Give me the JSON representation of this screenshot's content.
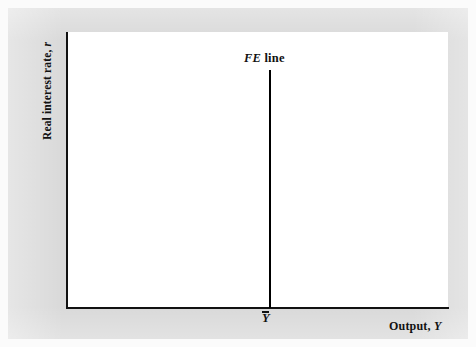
{
  "figure": {
    "type": "economics-diagram",
    "background_color": "#d9d9d9",
    "panel_color": "#ffffff",
    "line_color": "#000000"
  },
  "axes": {
    "y_title_main": "Real interest rate,",
    "y_title_symbol": "r",
    "x_title_main": "Output,",
    "x_title_symbol": "Y"
  },
  "annotations": {
    "fe_label_symbol": "FE",
    "fe_label_word": "line",
    "output_tick_symbol": "Y"
  },
  "chart_data": {
    "type": "line",
    "title": "",
    "xlabel": "Output, Y",
    "ylabel": "Real interest rate, r",
    "grid": false,
    "legend": "none",
    "series": [
      {
        "name": "FE line",
        "orientation": "vertical",
        "x_value": "Ybar",
        "points": [
          {
            "x": "Ybar",
            "y": "top"
          },
          {
            "x": "Ybar",
            "y": "axis"
          }
        ]
      }
    ],
    "tick_labels": {
      "x": [
        "Ȳ"
      ],
      "y": []
    },
    "annotations": [
      "FE line"
    ]
  }
}
